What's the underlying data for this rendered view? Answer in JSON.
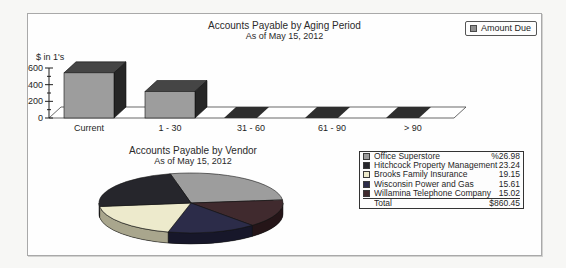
{
  "report": {
    "background": "#f7f7f5",
    "panel_border": "#a9a9a9"
  },
  "chart_data": [
    {
      "type": "bar",
      "title": "Accounts Payable by Aging Period",
      "subtitle": "As of May 15, 2012",
      "legend": [
        "Amount Due"
      ],
      "legend_position": "top-right",
      "ylabel": "$ in 1's",
      "ylim": [
        0,
        600
      ],
      "yticks": [
        0,
        200,
        400,
        600
      ],
      "minor_ticks": [
        100,
        300,
        500
      ],
      "categories": [
        "Current",
        "1 - 30",
        "31 - 60",
        "61 - 90",
        "> 90"
      ],
      "values": [
        542,
        318,
        0,
        0,
        0
      ],
      "bar_color": "#9d9d9d",
      "bar_top_color": "#454545",
      "bar_side_color": "#262626",
      "zero_bar_color": "#2e2e2e",
      "style": "3d"
    },
    {
      "type": "pie",
      "title": "Accounts Payable by Vendor",
      "subtitle": "As of May 15, 2012",
      "style": "3d",
      "legend_position": "right",
      "slices": [
        {
          "label": "Office Superstore",
          "percent": 26.98,
          "display": "%26.98",
          "color": "#9d9d9d",
          "side": "#646464"
        },
        {
          "label": "Hitchcock Property Management",
          "percent": 23.24,
          "display": "23.24",
          "color": "#26262c",
          "side": "#121216"
        },
        {
          "label": "Brooks Family Insurance",
          "percent": 19.15,
          "display": "19.15",
          "color": "#edeacc",
          "side": "#a9a68d"
        },
        {
          "label": "Wisconsin Power and Gas",
          "percent": 15.61,
          "display": "15.61",
          "color": "#2c2c49",
          "side": "#17172a"
        },
        {
          "label": "Willamina Telephone Company",
          "percent": 15.02,
          "display": "15.02",
          "color": "#402a2e",
          "side": "#251518"
        }
      ],
      "clockwise_order": [
        0,
        4,
        3,
        2,
        1
      ],
      "start_angle_deg": -13,
      "total_label": "Total",
      "total_display": "$860.45"
    }
  ]
}
